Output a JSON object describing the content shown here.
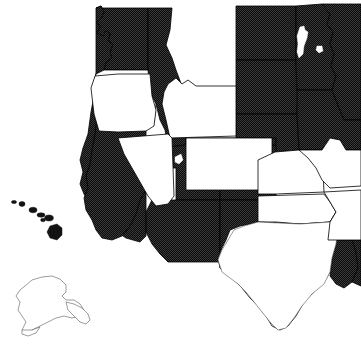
{
  "figure": {
    "title": "",
    "caption": "",
    "width": 361,
    "height": 346,
    "background_color": "#ffffff",
    "fill_color": "#000000",
    "empty_color": "#ffffff",
    "outline_color": "#000000",
    "style": "black-and-white dithered choropleth"
  },
  "legend": {
    "filled_label": "",
    "empty_label": ""
  },
  "map": {
    "region": "Western and Central United States",
    "projection_note": "Alaska and Hawaii shown as insets at lower left",
    "states": [
      {
        "id": "washington",
        "name": "Washington",
        "abbr": "WA",
        "status": "filled"
      },
      {
        "id": "oregon",
        "name": "Oregon",
        "abbr": "OR",
        "status": "empty"
      },
      {
        "id": "idaho",
        "name": "Idaho",
        "abbr": "ID",
        "status": "filled"
      },
      {
        "id": "montana",
        "name": "Montana",
        "abbr": "MT",
        "status": "empty"
      },
      {
        "id": "wyoming",
        "name": "Wyoming",
        "abbr": "WY",
        "status": "empty"
      },
      {
        "id": "california",
        "name": "California",
        "abbr": "CA",
        "status": "filled"
      },
      {
        "id": "nevada",
        "name": "Nevada",
        "abbr": "NV",
        "status": "empty"
      },
      {
        "id": "utah",
        "name": "Utah",
        "abbr": "UT",
        "status": "filled"
      },
      {
        "id": "colorado",
        "name": "Colorado",
        "abbr": "CO",
        "status": "filled"
      },
      {
        "id": "arizona",
        "name": "Arizona",
        "abbr": "AZ",
        "status": "filled"
      },
      {
        "id": "new-mexico",
        "name": "New Mexico",
        "abbr": "NM",
        "status": "filled"
      },
      {
        "id": "north-dakota",
        "name": "North Dakota",
        "abbr": "ND",
        "status": "filled"
      },
      {
        "id": "south-dakota",
        "name": "South Dakota",
        "abbr": "SD",
        "status": "filled"
      },
      {
        "id": "nebraska",
        "name": "Nebraska",
        "abbr": "NE",
        "status": "filled"
      },
      {
        "id": "kansas",
        "name": "Kansas",
        "abbr": "KS",
        "status": "empty"
      },
      {
        "id": "oklahoma",
        "name": "Oklahoma",
        "abbr": "OK",
        "status": "empty"
      },
      {
        "id": "texas",
        "name": "Texas",
        "abbr": "TX",
        "status": "empty"
      },
      {
        "id": "minnesota",
        "name": "Minnesota",
        "abbr": "MN",
        "status": "filled"
      },
      {
        "id": "iowa",
        "name": "Iowa",
        "abbr": "IA",
        "status": "empty"
      },
      {
        "id": "missouri",
        "name": "Missouri",
        "abbr": "MO",
        "status": "empty"
      },
      {
        "id": "arkansas",
        "name": "Arkansas",
        "abbr": "AR",
        "status": "empty"
      },
      {
        "id": "louisiana",
        "name": "Louisiana",
        "abbr": "LA",
        "status": "filled"
      },
      {
        "id": "wisconsin",
        "name": "Wisconsin",
        "abbr": "WI",
        "status": "filled"
      },
      {
        "id": "alaska",
        "name": "Alaska",
        "abbr": "AK",
        "status": "empty"
      },
      {
        "id": "hawaii",
        "name": "Hawaii",
        "abbr": "HI",
        "status": "filled"
      }
    ],
    "insets": [
      {
        "id": "alaska-inset",
        "name": "Alaska",
        "status": "empty"
      },
      {
        "id": "hawaii-inset",
        "name": "Hawaii",
        "status": "filled"
      }
    ],
    "water_features": [
      {
        "id": "lake-superior-west",
        "name": "Lake of the Woods / Red Lake"
      }
    ],
    "counts": {
      "filled": 13,
      "empty": 12
    }
  }
}
